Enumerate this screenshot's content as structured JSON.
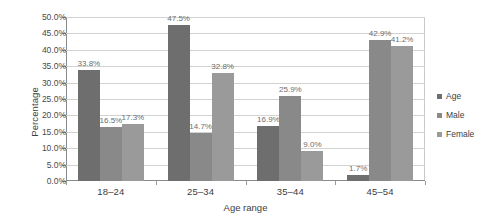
{
  "chart_data": {
    "type": "bar",
    "title": "",
    "xlabel": "Age range",
    "ylabel": "Percentage",
    "categories": [
      "18–24",
      "25–34",
      "35–44",
      "45–54"
    ],
    "series": [
      {
        "name": "Age",
        "color": "#6e6e6e",
        "values": [
          33.8,
          47.5,
          16.9,
          1.7
        ],
        "labels": [
          "33.8%",
          "47.5%",
          "16.9%",
          "1.7%"
        ]
      },
      {
        "name": "Male",
        "color": "#898989",
        "values": [
          16.5,
          14.7,
          25.9,
          42.9
        ],
        "labels": [
          "16.5%",
          "14.7%",
          "25.9%",
          "42.9%"
        ]
      },
      {
        "name": "Female",
        "color": "#9a9a9a",
        "values": [
          17.3,
          32.8,
          9.0,
          41.2
        ],
        "labels": [
          "17.3%",
          "32.8%",
          "9.0%",
          "41.2%"
        ]
      }
    ],
    "ylim": [
      0,
      50
    ],
    "ytick_values": [
      0,
      5,
      10,
      15,
      20,
      25,
      30,
      35,
      40,
      45,
      50
    ],
    "ytick_labels": [
      "0.0%",
      "5.0%",
      "10.0%",
      "15.0%",
      "20.0%",
      "25.0%",
      "30.0%",
      "35.0%",
      "40.0%",
      "45.0%",
      "50.0%"
    ],
    "grid": "horizontal",
    "legend_position": "right",
    "legend_entries": [
      "Age",
      "Male",
      "Female"
    ]
  }
}
